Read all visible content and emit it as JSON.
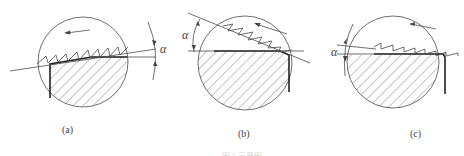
{
  "figure": {
    "panels": [
      {
        "id": "a",
        "label": "(a)",
        "angle_symbol": "α",
        "description": "Positive rake angle: cutting plane tilted above horizontal"
      },
      {
        "id": "b",
        "label": "(b)",
        "angle_symbol": "α",
        "description": "Rake angle measured from horizontal, plane sloping downward to the right"
      },
      {
        "id": "c",
        "label": "(c)",
        "angle_symbol": "α",
        "description": "Small rake angle: plane slightly tilted"
      }
    ],
    "caption": "图 1  示意图"
  },
  "colors": {
    "line": "#4a4a4a",
    "edge": "#222222",
    "background": "#ffffff"
  }
}
